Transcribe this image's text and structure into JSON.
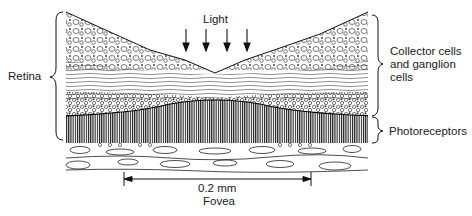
{
  "figure": {
    "labels": {
      "light": "Light",
      "retina": "Retina",
      "collector_cells": "Collector cells\nand ganglion\ncells",
      "photoreceptors": "Photoreceptors",
      "scale": "0.2 mm",
      "fovea": "Fovea"
    },
    "light_arrow_count": 4,
    "colors": {
      "ink": "#111111",
      "background": "#ffffff"
    }
  }
}
